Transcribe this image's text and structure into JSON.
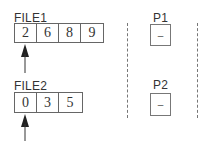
{
  "files": [
    {
      "label": "FILE1",
      "cells": [
        "2",
        "6",
        "8",
        "9"
      ],
      "pointer_index": 0
    },
    {
      "label": "FILE2",
      "cells": [
        "0",
        "3",
        "5"
      ],
      "pointer_index": 0
    }
  ],
  "processes": [
    {
      "label": "P1",
      "value": "–"
    },
    {
      "label": "P2",
      "value": "–"
    }
  ]
}
